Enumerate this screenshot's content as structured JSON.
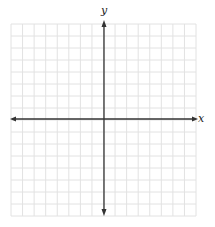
{
  "diagram": {
    "type": "coordinate-plane",
    "x_axis_label": "x",
    "y_axis_label": "y",
    "grid": {
      "columns": 16,
      "rows": 16,
      "left": 11,
      "top": 24,
      "right": 196,
      "bottom": 216,
      "line_color": "#e2e2e2"
    },
    "axes": {
      "origin_x": 104,
      "origin_y": 119,
      "color": "#333333",
      "arrows": [
        "left",
        "right",
        "up",
        "down"
      ]
    }
  }
}
